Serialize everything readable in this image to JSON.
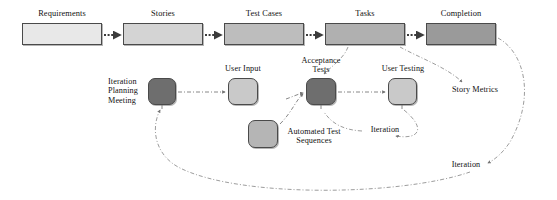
{
  "diagram": {
    "colors": {
      "stage_1": "#e8e8e8",
      "stage_2": "#d4d4d4",
      "stage_3": "#bdbdbd",
      "stage_4": "#b0b0b0",
      "stage_5": "#9a9a9a",
      "node_dark": "#6e6e6e",
      "node_light": "#c9c9c9",
      "node_mid": "#b5b5b5",
      "border": "#4a4a4a",
      "edge": "#6b6b6b",
      "text": "#111111"
    },
    "stages": [
      {
        "id": "requirements",
        "label": "Requirements",
        "x": 22,
        "y": 23,
        "w": 80,
        "h": 22,
        "fill": "#e8e8e8",
        "label_x": 22,
        "label_y": 9
      },
      {
        "id": "stories",
        "label": "Stories",
        "x": 123,
        "y": 23,
        "w": 80,
        "h": 22,
        "fill": "#d4d4d4",
        "label_x": 123,
        "label_y": 9
      },
      {
        "id": "test-cases",
        "label": "Test Cases",
        "x": 224,
        "y": 23,
        "w": 80,
        "h": 22,
        "fill": "#bdbdbd",
        "label_x": 224,
        "label_y": 9
      },
      {
        "id": "tasks",
        "label": "Tasks",
        "x": 325,
        "y": 23,
        "w": 80,
        "h": 22,
        "fill": "#b0b0b0",
        "label_x": 325,
        "label_y": 9
      },
      {
        "id": "completion",
        "label": "Completion",
        "x": 426,
        "y": 23,
        "w": 70,
        "h": 22,
        "fill": "#9a9a9a",
        "label_x": 426,
        "label_y": 9
      }
    ],
    "nodes": [
      {
        "id": "iteration-planning-meeting",
        "label": "Iteration\nPlanning\nMeeting",
        "x": 148,
        "y": 78,
        "w": 28,
        "h": 27,
        "fill": "#6e6e6e",
        "label_x": 108,
        "label_y": 77,
        "label_w": 40,
        "align": "left"
      },
      {
        "id": "user-input",
        "label": "User Input",
        "x": 228,
        "y": 78,
        "w": 30,
        "h": 27,
        "fill": "#c9c9c9",
        "label_x": 213,
        "label_y": 64,
        "label_w": 60,
        "align": "center"
      },
      {
        "id": "acceptance-tests",
        "label": "Acceptance\nTests",
        "x": 306,
        "y": 78,
        "w": 30,
        "h": 27,
        "fill": "#6e6e6e",
        "label_x": 283,
        "label_y": 56,
        "label_w": 76,
        "align": "center"
      },
      {
        "id": "user-testing",
        "label": "User Testing",
        "x": 388,
        "y": 78,
        "w": 29,
        "h": 27,
        "fill": "#c9c9c9",
        "label_x": 370,
        "label_y": 64,
        "label_w": 66,
        "align": "center"
      },
      {
        "id": "automated-test-sequences",
        "label": "Automated Test\nSequences",
        "x": 248,
        "y": 120,
        "w": 30,
        "h": 28,
        "fill": "#b5b5b5",
        "label_x": 276,
        "label_y": 127,
        "label_w": 76,
        "align": "center"
      }
    ],
    "free_labels": [
      {
        "id": "story-metrics",
        "text": "Story Metrics",
        "x": 443,
        "y": 85,
        "w": 64,
        "align": "center"
      },
      {
        "id": "iteration-inner",
        "text": "Iteration",
        "x": 365,
        "y": 125,
        "w": 40,
        "align": "center"
      },
      {
        "id": "iteration-outer",
        "text": "Iteration",
        "x": 444,
        "y": 160,
        "w": 44,
        "align": "center"
      }
    ]
  }
}
